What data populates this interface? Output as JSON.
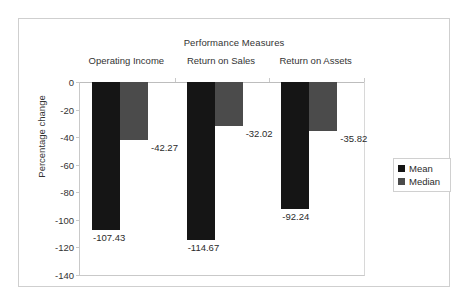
{
  "chart_data": {
    "type": "bar",
    "title": "Performance Measures",
    "xlabel": "",
    "ylabel": "Percentage change",
    "categories": [
      "Operating Income",
      "Return on Sales",
      "Return on Assets"
    ],
    "series": [
      {
        "name": "Mean",
        "color": "#151515",
        "values": [
          -107.43,
          -114.67,
          -92.24
        ]
      },
      {
        "name": "Median",
        "color": "#4b4b4b",
        "values": [
          -42.27,
          -32.02,
          -35.82
        ]
      }
    ],
    "value_labels": [
      [
        "-107.43",
        "-114.67",
        "-92.24"
      ],
      [
        "-42.27",
        "-32.02",
        "-35.82"
      ]
    ],
    "ylim": [
      -140,
      0
    ],
    "yticks": [
      0,
      -20,
      -40,
      -60,
      -80,
      -100,
      -120,
      -140
    ],
    "ytick_labels": [
      "0",
      "-20",
      "-40",
      "-60",
      "-80",
      "-100",
      "-120",
      "-140"
    ],
    "grid": false,
    "legend_position": "right",
    "category_labels_position": "top"
  }
}
